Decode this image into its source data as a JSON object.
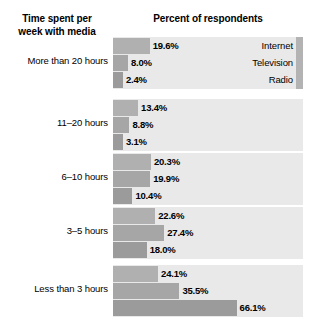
{
  "header": {
    "category_title_line1": "Time spent per",
    "category_title_line2": "week with media",
    "value_title": "Percent of respondents"
  },
  "legend": {
    "series": [
      "Internet",
      "Television",
      "Radio"
    ],
    "shown_on_group": 0,
    "position": "inside-first-band-right"
  },
  "chart_data": {
    "type": "bar",
    "orientation": "horizontal",
    "title": "Percent of respondents",
    "xlabel": "Percent of respondents",
    "ylabel": "Time spent per week with media",
    "categories": [
      "More than 20 hours",
      "11–20 hours",
      "6–10 hours",
      "3–5 hours",
      "Less than 3 hours"
    ],
    "series": [
      {
        "name": "Internet",
        "values": [
          19.6,
          13.4,
          20.3,
          22.6,
          24.1
        ],
        "labels": [
          "19.6%",
          "13.4%",
          "20.3%",
          "22.6%",
          "24.1%"
        ],
        "color": "#b0b0b0"
      },
      {
        "name": "Television",
        "values": [
          8.0,
          8.8,
          19.9,
          27.4,
          35.5
        ],
        "labels": [
          "8.0%",
          "8.8%",
          "19.9%",
          "27.4%",
          "35.5%"
        ],
        "color": "#a6a6a6"
      },
      {
        "name": "Radio",
        "values": [
          2.4,
          3.1,
          10.4,
          18.0,
          66.1
        ],
        "labels": [
          "2.4%",
          "3.1%",
          "10.4%",
          "18.0%",
          "66.1%"
        ],
        "color": "#9b9b9b"
      }
    ],
    "xlim": [
      0,
      100
    ],
    "grid": false,
    "legend_position": "right-of-bars-first-group",
    "value_labels": true,
    "background_band_color": "#e9e9e9"
  },
  "groups": [
    {
      "label": "More than 20 hours",
      "rows": [
        {
          "series": "Internet",
          "value": 19.6,
          "label": "19.6%"
        },
        {
          "series": "Television",
          "value": 8.0,
          "label": "8.0%"
        },
        {
          "series": "Radio",
          "value": 2.4,
          "label": "2.4%"
        }
      ]
    },
    {
      "label": "11–20 hours",
      "rows": [
        {
          "series": "Internet",
          "value": 13.4,
          "label": "13.4%"
        },
        {
          "series": "Television",
          "value": 8.8,
          "label": "8.8%"
        },
        {
          "series": "Radio",
          "value": 3.1,
          "label": "3.1%"
        }
      ]
    },
    {
      "label": "6–10 hours",
      "rows": [
        {
          "series": "Internet",
          "value": 20.3,
          "label": "20.3%"
        },
        {
          "series": "Television",
          "value": 19.9,
          "label": "19.9%"
        },
        {
          "series": "Radio",
          "value": 10.4,
          "label": "10.4%"
        }
      ]
    },
    {
      "label": "3–5 hours",
      "rows": [
        {
          "series": "Internet",
          "value": 22.6,
          "label": "22.6%"
        },
        {
          "series": "Television",
          "value": 27.4,
          "label": "27.4%"
        },
        {
          "series": "Radio",
          "value": 18.0,
          "label": "18.0%"
        }
      ]
    },
    {
      "label": "Less than 3 hours",
      "rows": [
        {
          "series": "Internet",
          "value": 24.1,
          "label": "24.1%"
        },
        {
          "series": "Television",
          "value": 35.5,
          "label": "35.5%"
        },
        {
          "series": "Radio",
          "value": 66.1,
          "label": "66.1%"
        }
      ]
    }
  ],
  "layout": {
    "band_left": 113,
    "band_width": 190,
    "group_tops": [
      37,
      99,
      153,
      207,
      265
    ],
    "group_height": 52,
    "px_per_percent": 1.87,
    "bar_min_width": 10
  }
}
